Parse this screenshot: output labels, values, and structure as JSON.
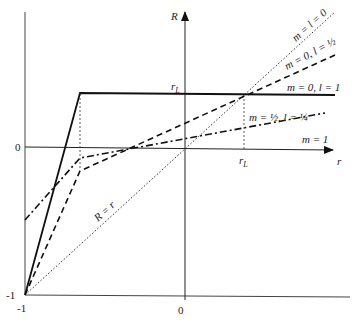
{
  "axes": {
    "y_label": "R",
    "x_label": "r",
    "origin_label_y": "0",
    "origin_label_x": "0",
    "min_label_y": "-1",
    "min_label_x": "-1",
    "rL_label_x": "r_L",
    "rL_label_y": "r_L"
  },
  "curves": [
    {
      "name": "m = l = 0",
      "style": "dotted"
    },
    {
      "name": "m = 0, l = 1/2",
      "style": "dashed"
    },
    {
      "name": "m = 0, l = 1",
      "style": "solid"
    },
    {
      "name": "m = 1/2, l = 1/4",
      "style": "dash-dot"
    },
    {
      "name": "m = 1",
      "style": "solid-axis"
    },
    {
      "name": "R = r",
      "style": "dotted"
    }
  ],
  "labels": {
    "m_l_0": "m = l = 0",
    "m0_lhalf_a": "m = 0, l = ",
    "m0_l1": "m = 0, l = 1",
    "mhalf_a": "m = ",
    "mhalf_b": ", l = ",
    "m1": "m = 1",
    "R_eq_r": "R = r",
    "half_num": "1",
    "half_den": "2",
    "quarter_num": "1",
    "quarter_den": "4"
  }
}
